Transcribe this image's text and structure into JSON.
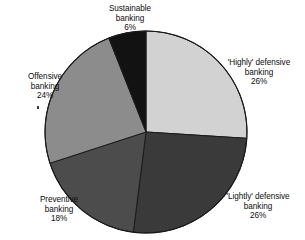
{
  "chart_data": {
    "type": "pie",
    "title": "",
    "subtitle": "",
    "xlabel": "",
    "ylabel": "",
    "legend_position": "none",
    "grid": false,
    "labels_placement": "outside-callout",
    "start_angle_deg": 0,
    "direction": "clockwise",
    "categories": [
      "'Highly' defensive banking",
      "'Lightly' defensive banking",
      "Preventive banking",
      "Offensive banking",
      "Sustainable banking"
    ],
    "values": [
      26,
      26,
      18,
      24,
      6
    ],
    "value_suffix": "%",
    "colors": [
      "#d2d2d2",
      "#3a3a3a",
      "#4c4c4c",
      "#8c8c8c",
      "#121212"
    ],
    "slices": [
      {
        "name": "'Highly' defensive banking",
        "value": 26,
        "value_text": "26%",
        "color": "#d2d2d2",
        "label_line_1": "'Highly' defensive",
        "label_line_2": "banking",
        "label_line_3": "26%"
      },
      {
        "name": "'Lightly' defensive banking",
        "value": 26,
        "value_text": "26%",
        "color": "#3a3a3a",
        "label_line_1": "'Lightly' defensive",
        "label_line_2": "banking",
        "label_line_3": "26%"
      },
      {
        "name": "Preventive banking",
        "value": 18,
        "value_text": "18%",
        "color": "#4c4c4c",
        "label_line_1": "Preventive",
        "label_line_2": "banking",
        "label_line_3": "18%"
      },
      {
        "name": "Offensive banking",
        "value": 24,
        "value_text": "24%",
        "color": "#8c8c8c",
        "label_line_1": "Offensive",
        "label_line_2": "banking",
        "label_line_3": "24%"
      },
      {
        "name": "Sustainable banking",
        "value": 6,
        "value_text": "6%",
        "color": "#121212",
        "label_line_1": "Sustainable",
        "label_line_2": "banking",
        "label_line_3": "6%"
      }
    ]
  },
  "geometry": {
    "center_x": 146,
    "center_y": 132,
    "radius": 101,
    "outline_color": "#1a1a1a"
  }
}
